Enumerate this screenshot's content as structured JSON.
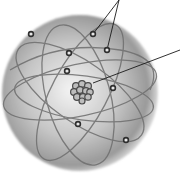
{
  "diagram": {
    "type": "atom-model",
    "colors": {
      "background": "#ffffff",
      "sphere_light": "#f2f2f2",
      "sphere_mid": "#bdbdbd",
      "sphere_dark": "#8a8a8a",
      "orbit": "#6e6e6e",
      "electron": "#2e2e2e",
      "leader_line": "#1a1a1a"
    },
    "sphere": {
      "cx": 80,
      "cy": 93,
      "r": 78
    },
    "nucleus": {
      "cx": 82,
      "cy": 90,
      "label": ""
    },
    "electrons": [
      {
        "cx": 31,
        "cy": 34
      },
      {
        "cx": 69,
        "cy": 53
      },
      {
        "cx": 67,
        "cy": 71
      },
      {
        "cx": 93,
        "cy": 34
      },
      {
        "cx": 107,
        "cy": 50
      },
      {
        "cx": 113,
        "cy": 88
      },
      {
        "cx": 78,
        "cy": 124
      },
      {
        "cx": 126,
        "cy": 140
      }
    ],
    "leader_lines": [
      {
        "name": "electron-leader-1",
        "from": [
          93,
          34
        ],
        "to": [
          119,
          0
        ]
      },
      {
        "name": "electron-leader-2",
        "from": [
          107,
          50
        ],
        "to": [
          119,
          0
        ]
      },
      {
        "name": "nucleus-leader",
        "from": [
          93,
          83
        ],
        "to": [
          180,
          50
        ]
      }
    ]
  }
}
